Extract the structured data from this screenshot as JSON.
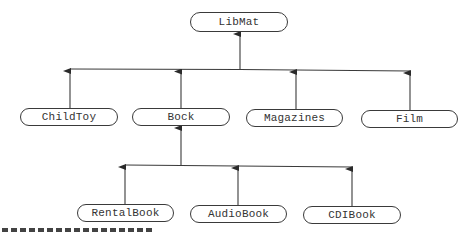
{
  "diagram": {
    "type": "class-hierarchy",
    "root": {
      "label": "LibMat",
      "box": {
        "x": 190,
        "y": 12,
        "w": 98,
        "h": 20
      }
    },
    "level1": [
      {
        "label": "ChildToy",
        "box": {
          "x": 20,
          "y": 108,
          "w": 98,
          "h": 18
        },
        "anchor_x": 70
      },
      {
        "label": "Bock",
        "box": {
          "x": 132,
          "y": 108,
          "w": 98,
          "h": 18
        },
        "anchor_x": 181
      },
      {
        "label": "Magazines",
        "box": {
          "x": 246,
          "y": 109,
          "w": 97,
          "h": 18
        },
        "anchor_x": 296
      },
      {
        "label": "Film",
        "box": {
          "x": 361,
          "y": 110,
          "w": 97,
          "h": 18
        },
        "anchor_x": 410
      }
    ],
    "level2_parent": "Bock",
    "level2": [
      {
        "label": "RentalBook",
        "box": {
          "x": 77,
          "y": 204,
          "w": 97,
          "h": 18
        },
        "anchor_x": 125
      },
      {
        "label": "AudioBook",
        "box": {
          "x": 190,
          "y": 205,
          "w": 97,
          "h": 18
        },
        "anchor_x": 238
      },
      {
        "label": "CDIBook",
        "box": {
          "x": 303,
          "y": 206,
          "w": 98,
          "h": 18
        },
        "anchor_x": 352
      }
    ],
    "edges": [
      {
        "from": "ChildToy",
        "to": "LibMat"
      },
      {
        "from": "Bock",
        "to": "LibMat"
      },
      {
        "from": "Magazines",
        "to": "LibMat"
      },
      {
        "from": "Film",
        "to": "LibMat"
      },
      {
        "from": "RentalBook",
        "to": "Bock"
      },
      {
        "from": "AudioBook",
        "to": "Bock"
      },
      {
        "from": "CDIBook",
        "to": "Bock"
      }
    ],
    "colors": {
      "line": "#3a3a3a",
      "text": "#333333",
      "background": "#ffffff"
    }
  }
}
